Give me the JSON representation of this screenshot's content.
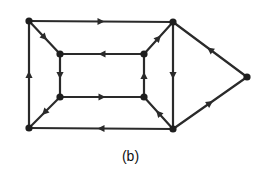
{
  "figure": {
    "caption": "(b)",
    "colors": {
      "edge": "#2a2a2a",
      "node": "#1e1e1e",
      "background": "#ffffff"
    }
  },
  "graph": {
    "type": "directed",
    "nodes": [
      {
        "id": "TL",
        "x": 29,
        "y": 21
      },
      {
        "id": "TR",
        "x": 173,
        "y": 22
      },
      {
        "id": "R",
        "x": 247,
        "y": 77
      },
      {
        "id": "BR",
        "x": 173,
        "y": 129
      },
      {
        "id": "BL",
        "x": 29,
        "y": 128
      },
      {
        "id": "ITL",
        "x": 60,
        "y": 54
      },
      {
        "id": "ITR",
        "x": 144,
        "y": 54
      },
      {
        "id": "IBL",
        "x": 60,
        "y": 97
      },
      {
        "id": "IBR",
        "x": 144,
        "y": 97
      }
    ],
    "edges": [
      {
        "from": "TL",
        "to": "TR",
        "label": "outer top"
      },
      {
        "from": "BL",
        "to": "TL",
        "label": "outer left"
      },
      {
        "from": "BR",
        "to": "BL",
        "label": "outer bottom"
      },
      {
        "from": "TR",
        "to": "BR",
        "label": "right vertical"
      },
      {
        "from": "R",
        "to": "TR",
        "label": "upper diagonal (inferred)"
      },
      {
        "from": "BR",
        "to": "R",
        "label": "lower diagonal"
      },
      {
        "from": "TL",
        "to": "ITL",
        "label": "corner TL"
      },
      {
        "from": "ITR",
        "to": "TR",
        "label": "corner TR"
      },
      {
        "from": "BR",
        "to": "IBR",
        "label": "corner BR"
      },
      {
        "from": "IBL",
        "to": "BL",
        "label": "corner BL"
      },
      {
        "from": "ITR",
        "to": "ITL",
        "label": "inner top"
      },
      {
        "from": "ITL",
        "to": "IBL",
        "label": "inner left"
      },
      {
        "from": "IBL",
        "to": "IBR",
        "label": "inner bottom"
      },
      {
        "from": "IBR",
        "to": "ITR",
        "label": "inner right"
      }
    ]
  }
}
